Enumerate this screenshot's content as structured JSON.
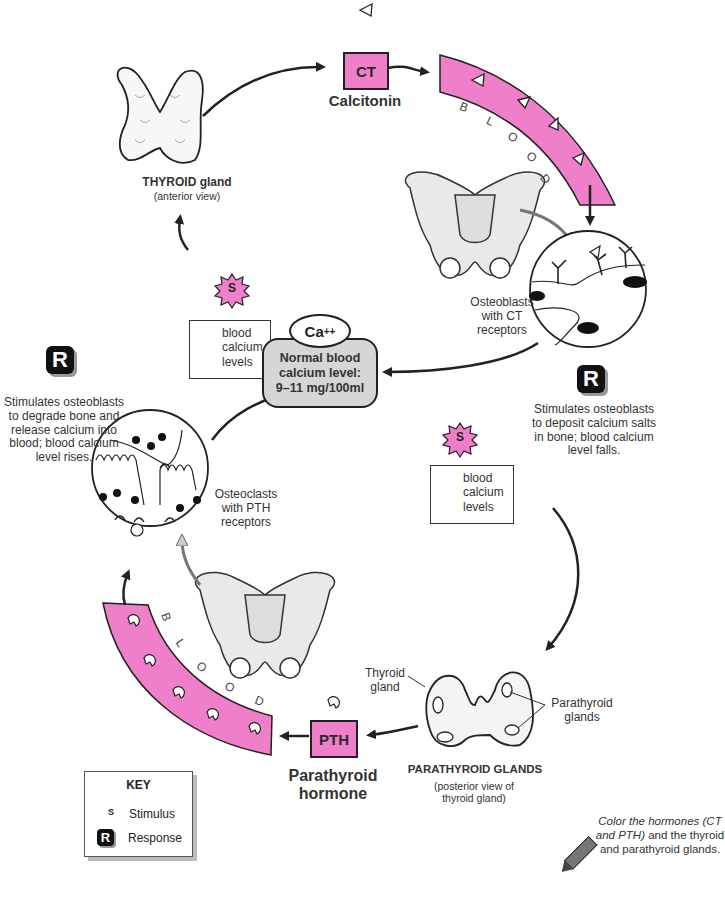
{
  "colors": {
    "hormone_pink": "#f07fc9",
    "center_gray": "#d6d6d6",
    "outline": "#222222",
    "response_black": "#111111"
  },
  "top_cycle": {
    "thyroid": {
      "label": "THYROID gland",
      "sublabel": "(anterior view)"
    },
    "hormone": {
      "abbr": "CT",
      "name": "Calcitonin",
      "symbol_icon": "triangle-icon"
    },
    "blood_label": [
      "B",
      "L",
      "O",
      "O",
      "D"
    ],
    "target_cells": {
      "label": "Osteoblasts with CT receptors"
    },
    "response": {
      "badge": "R",
      "text": "Stimulates osteoblasts to deposit calcium salts in bone; blood calcium level falls."
    },
    "stimulus": {
      "badge": "S",
      "direction": "up",
      "text": "blood calcium levels"
    }
  },
  "center": {
    "ion": "Ca++",
    "ion_base": "Ca",
    "ion_sup": "++",
    "line1": "Normal blood",
    "line2": "calcium level:",
    "line3": "9–11 mg/100ml"
  },
  "bottom_cycle": {
    "stimulus": {
      "badge": "S",
      "direction": "down",
      "text": "blood calcium levels"
    },
    "parathyroid": {
      "label": "PARATHYROID GLANDS",
      "sublabel": "(posterior view of thyroid gland)",
      "callout_thyroid": "Thyroid gland",
      "callout_parathyroid": "Parathyroid glands"
    },
    "hormone": {
      "abbr": "PTH",
      "name_line1": "Parathyroid",
      "name_line2": "hormone",
      "symbol_icon": "pth-molecule-icon"
    },
    "blood_label": [
      "B",
      "L",
      "O",
      "O",
      "D"
    ],
    "target_cells": {
      "label": "Osteoclasts with PTH receptors"
    },
    "response": {
      "badge": "R",
      "text": "Stimulates osteoblasts to degrade bone and release calcium into blood; blood calcium level rises."
    }
  },
  "key": {
    "title": "KEY",
    "stimulus_badge": "S",
    "stimulus_label": "Stimulus",
    "response_badge": "R",
    "response_label": "Response"
  },
  "instruction": {
    "italic": "Color the hormones (CT and PTH)",
    "normal": " and the thyroid and parathyroid glands.",
    "icon": "crayon-icon"
  }
}
